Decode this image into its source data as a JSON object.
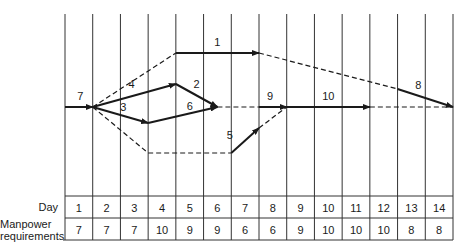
{
  "diagram": {
    "days_label": "Day",
    "manpower_label_line1": "Manpower",
    "manpower_label_line2": "requirements",
    "days": [
      "1",
      "2",
      "3",
      "4",
      "5",
      "6",
      "7",
      "8",
      "9",
      "10",
      "11",
      "12",
      "13",
      "14"
    ],
    "manpower": [
      "7",
      "7",
      "7",
      "10",
      "9",
      "9",
      "6",
      "6",
      "9",
      "10",
      "10",
      "10",
      "8",
      "8"
    ],
    "activities": [
      {
        "label": "7",
        "x1": 0,
        "y1": 107,
        "x2": 1,
        "y2": 107,
        "type": "solid",
        "arrow": true,
        "lx": 0.55,
        "ly": 100
      },
      {
        "label": "4",
        "x1": 1,
        "y1": 107,
        "x2": 4,
        "y2": 84,
        "type": "solid",
        "arrow": true,
        "lx": 2.4,
        "ly": 88
      },
      {
        "label": "3",
        "x1": 1,
        "y1": 107,
        "x2": 3,
        "y2": 123,
        "type": "solid",
        "arrow": true,
        "lx": 2.1,
        "ly": 111
      },
      {
        "label": "2",
        "x1": 4,
        "y1": 84,
        "x2": 5.5,
        "y2": 107,
        "type": "solid",
        "arrow": true,
        "lx": 4.75,
        "ly": 88
      },
      {
        "label": "6",
        "x1": 3,
        "y1": 123,
        "x2": 5.5,
        "y2": 107,
        "type": "solid",
        "arrow": true,
        "lx": 4.5,
        "ly": 110
      },
      {
        "label": "1",
        "x1": 4,
        "y1": 53,
        "x2": 7,
        "y2": 53,
        "type": "solid",
        "arrow": true,
        "lx": 5.5,
        "ly": 46
      },
      {
        "label": "9",
        "x1": 7,
        "y1": 107,
        "x2": 8,
        "y2": 107,
        "type": "solid",
        "arrow": true,
        "lx": 7.4,
        "ly": 100
      },
      {
        "label": "10",
        "x1": 8,
        "y1": 107,
        "x2": 11,
        "y2": 107,
        "type": "solid",
        "arrow": true,
        "lx": 9.5,
        "ly": 100
      },
      {
        "label": "8",
        "x1": 12,
        "y1": 89,
        "x2": 14,
        "y2": 107,
        "type": "solid",
        "arrow": true,
        "lx": 12.75,
        "ly": 89
      },
      {
        "label": "5",
        "x1": 6,
        "y1": 153,
        "x2": 7,
        "y2": 128,
        "type": "solid",
        "arrow": true,
        "lx": 5.95,
        "ly": 139
      },
      {
        "label": "",
        "x1": 1,
        "y1": 107,
        "x2": 4,
        "y2": 53,
        "type": "dashed",
        "arrow": false
      },
      {
        "label": "",
        "x1": 7,
        "y1": 53,
        "x2": 12,
        "y2": 89,
        "type": "dashed",
        "arrow": false
      },
      {
        "label": "",
        "x1": 5.5,
        "y1": 107,
        "x2": 7,
        "y2": 107,
        "type": "dashed",
        "arrow": false
      },
      {
        "label": "",
        "x1": 11,
        "y1": 107,
        "x2": 14,
        "y2": 107,
        "type": "dashed",
        "arrow": false
      },
      {
        "label": "",
        "x1": 1,
        "y1": 107,
        "x2": 3,
        "y2": 153,
        "type": "dashed",
        "arrow": false
      },
      {
        "label": "",
        "x1": 3,
        "y1": 153,
        "x2": 6,
        "y2": 153,
        "type": "dashed",
        "arrow": false
      },
      {
        "label": "",
        "x1": 7,
        "y1": 128,
        "x2": 8,
        "y2": 107,
        "type": "dashed",
        "arrow": false
      }
    ]
  }
}
